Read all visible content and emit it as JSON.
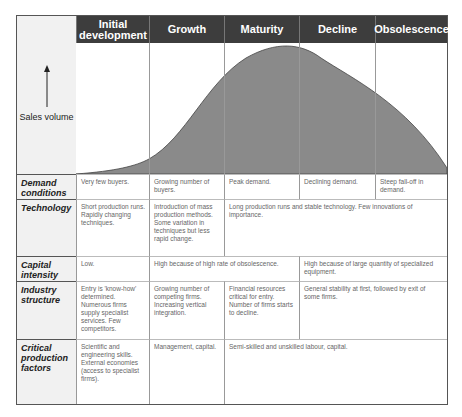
{
  "stages": [
    "Initial development",
    "Growth",
    "Maturity",
    "Decline",
    "Obsolescence"
  ],
  "y_axis_label": "Sales volume",
  "rows": [
    {
      "label": "Demand conditions",
      "cells": [
        "Very few buyers.",
        "Growing number of buyers.",
        "Peak demand.",
        "Declining demand.",
        "Steep fall-off in demand."
      ]
    },
    {
      "label": "Technology",
      "cells": [
        "Short production runs. Rapidly changing techniques.",
        "Introduction of mass production methods. Some variation in techniques but less rapid change.",
        "Long production runs and stable technology. Few innovations of importance."
      ]
    },
    {
      "label": "Capital intensity",
      "cells": [
        "Low.",
        "High because of high rate of obsolescence.",
        "High because of large quantity of specialized equipment."
      ]
    },
    {
      "label": "Industry structure",
      "cells": [
        "Entry is 'know-how' determined. Numerous firms supply specialist services. Few competitors.",
        "Growing number of competing firms. Increasing vertical integration.",
        "Financial resources critical for entry. Number of firms starts to decline.",
        "General stability at first, followed by exit of some firms."
      ]
    },
    {
      "label": "Critical production factors",
      "cells": [
        "Scientific and engineering skills. External economies (access to specialist firms).",
        "Management, capital.",
        "Semi-skilled and unskilled labour, capital."
      ]
    }
  ],
  "colors": {
    "header_bg": "#3d3d3d",
    "curve_fill": "#8a8a8a",
    "label_bg": "#f1f1f1"
  }
}
